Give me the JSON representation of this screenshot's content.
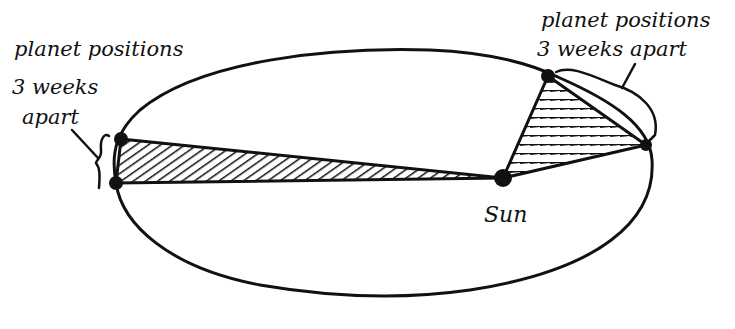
{
  "diagram": {
    "labels": {
      "left_line1": "planet positions",
      "left_line2": "3 weeks",
      "left_line3": "apart",
      "right_line1": "planet positions",
      "right_line2": "3 weeks apart",
      "sun": "Sun"
    },
    "orbit": {
      "shape": "ellipse",
      "cx": 383,
      "cy": 171,
      "rx": 272,
      "ry": 124
    },
    "sun": {
      "x": 503,
      "y": 178
    },
    "planet_positions": {
      "aphelion_pair": [
        {
          "x": 121,
          "y": 139
        },
        {
          "x": 116,
          "y": 183
        }
      ],
      "perihelion_pair": [
        {
          "x": 548,
          "y": 76
        },
        {
          "x": 646,
          "y": 145
        }
      ]
    },
    "sectors": [
      {
        "name": "far-sector",
        "hatch": "diagonal"
      },
      {
        "name": "near-sector",
        "hatch": "horizontal"
      }
    ],
    "colors": {
      "ink": "#111111",
      "background": "#ffffff"
    }
  }
}
